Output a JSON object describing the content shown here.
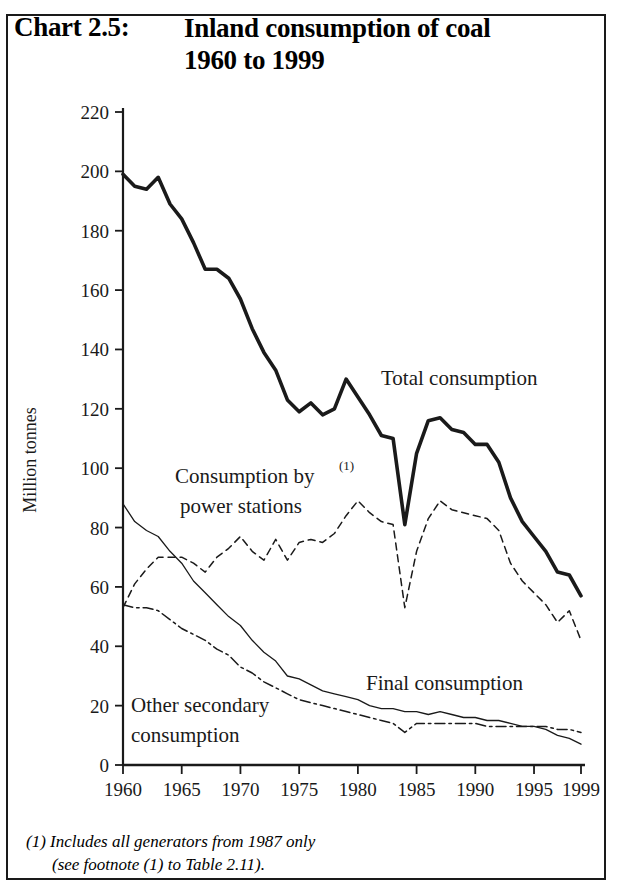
{
  "header": {
    "chart_number": "Chart 2.5:",
    "title_line1": "Inland consumption of coal",
    "title_line2": "1960 to 1999"
  },
  "footnote": {
    "line1": "(1) Includes all generators from 1987 only",
    "line2": "(see footnote (1) to Table 2.11)."
  },
  "labels": {
    "total": "Total consumption",
    "power": "Consumption by",
    "power2": "power stations",
    "power_superscript": "(1)",
    "final": "Final consumption",
    "other": "Other secondary",
    "other2": "consumption"
  },
  "colors": {
    "ink": "#1a1a1a",
    "line": "#000000",
    "frame": "#1a1a1a"
  },
  "chart_data": {
    "type": "line",
    "title": "Inland consumption of coal 1960 to 1999",
    "subtitle": "Chart 2.5",
    "xlabel": "",
    "ylabel": "Million tonnes",
    "xlim": [
      1960,
      1999
    ],
    "ylim": [
      0,
      220
    ],
    "ytick_labels": [
      "0",
      "20",
      "40",
      "60",
      "80",
      "100",
      "120",
      "140",
      "160",
      "180",
      "200",
      "220"
    ],
    "yticks": [
      0,
      20,
      40,
      60,
      80,
      100,
      120,
      140,
      160,
      180,
      200,
      220
    ],
    "xtick_labels": [
      "1960",
      "1965",
      "1970",
      "1975",
      "1980",
      "1985",
      "1990",
      "1995",
      "1999"
    ],
    "xticks": [
      1960,
      1965,
      1970,
      1975,
      1980,
      1985,
      1990,
      1995,
      1999
    ],
    "grid": false,
    "legend_position": "inline-annotations",
    "x": [
      1960,
      1961,
      1962,
      1963,
      1964,
      1965,
      1966,
      1967,
      1968,
      1969,
      1970,
      1971,
      1972,
      1973,
      1974,
      1975,
      1976,
      1977,
      1978,
      1979,
      1980,
      1981,
      1982,
      1983,
      1984,
      1985,
      1986,
      1987,
      1988,
      1989,
      1990,
      1991,
      1992,
      1993,
      1994,
      1995,
      1996,
      1997,
      1998,
      1999
    ],
    "series": [
      {
        "name": "Total consumption",
        "style": "thick-solid",
        "values": [
          199,
          195,
          194,
          198,
          189,
          184,
          176,
          167,
          167,
          164,
          157,
          147,
          139,
          133,
          123,
          119,
          122,
          118,
          120,
          130,
          124,
          118,
          111,
          110,
          81,
          105,
          116,
          117,
          113,
          112,
          108,
          108,
          102,
          90,
          82,
          77,
          72,
          65,
          64,
          57
        ]
      },
      {
        "name": "Consumption by power stations",
        "style": "dashed",
        "values": [
          53,
          61,
          66,
          70,
          70,
          70,
          68,
          65,
          70,
          73,
          77,
          72,
          69,
          76,
          69,
          75,
          76,
          75,
          78,
          84,
          89,
          85,
          82,
          81,
          53,
          72,
          83,
          89,
          86,
          85,
          84,
          83,
          79,
          68,
          62,
          58,
          54,
          48,
          52,
          42
        ]
      },
      {
        "name": "Final consumption",
        "style": "thin-solid",
        "values": [
          88,
          82,
          79,
          77,
          72,
          68,
          62,
          58,
          54,
          50,
          47,
          42,
          38,
          35,
          30,
          29,
          27,
          25,
          24,
          23,
          22,
          20,
          19,
          19,
          18,
          18,
          17,
          18,
          17,
          16,
          16,
          15,
          15,
          14,
          13,
          13,
          12,
          10,
          9,
          7
        ]
      },
      {
        "name": "Other secondary consumption",
        "style": "dash-dot",
        "values": [
          54,
          53,
          53,
          52,
          49,
          46,
          44,
          42,
          39,
          37,
          33,
          31,
          28,
          26,
          24,
          22,
          21,
          20,
          19,
          18,
          17,
          16,
          15,
          14,
          11,
          14,
          14,
          14,
          14,
          14,
          14,
          13,
          13,
          13,
          13,
          13,
          13,
          12,
          12,
          11
        ]
      }
    ]
  }
}
